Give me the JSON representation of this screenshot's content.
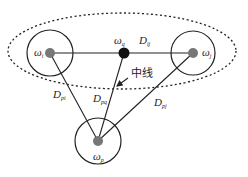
{
  "diagram": {
    "title": "",
    "colors": {
      "line": "#222222",
      "node_fill": "#777777",
      "center_fill": "#111111",
      "background": "#ffffff"
    },
    "nodes": [
      {
        "id": "i",
        "symbol": "ω",
        "subscript": "i",
        "x": 50,
        "y": 53,
        "circle_r": 23,
        "type": "gray"
      },
      {
        "id": "q",
        "symbol": "ω",
        "subscript": "q",
        "x": 124,
        "y": 53,
        "circle_r": 0,
        "type": "center"
      },
      {
        "id": "j",
        "symbol": "ω",
        "subscript": "j",
        "x": 193,
        "y": 53,
        "circle_r": 22,
        "type": "gray"
      },
      {
        "id": "p",
        "symbol": "ω",
        "subscript": "p",
        "x": 98,
        "y": 141,
        "circle_r": 23,
        "type": "gray"
      }
    ],
    "edges": [
      {
        "from": "i",
        "to": "j",
        "label_symbol": "D",
        "label_sub": "ij"
      },
      {
        "from": "p",
        "to": "i",
        "label_symbol": "D",
        "label_sub": "pi"
      },
      {
        "from": "p",
        "to": "q",
        "label_symbol": "D",
        "label_sub": "pq"
      },
      {
        "from": "p",
        "to": "j",
        "label_symbol": "D",
        "label_sub": "pj"
      }
    ],
    "annotation": {
      "text": "中线",
      "meaning": "median line",
      "arrow_target": "p-q edge"
    },
    "cluster_ellipse": {
      "cx": 122,
      "cy": 51,
      "rx": 114,
      "ry": 38,
      "style": "dotted"
    }
  }
}
